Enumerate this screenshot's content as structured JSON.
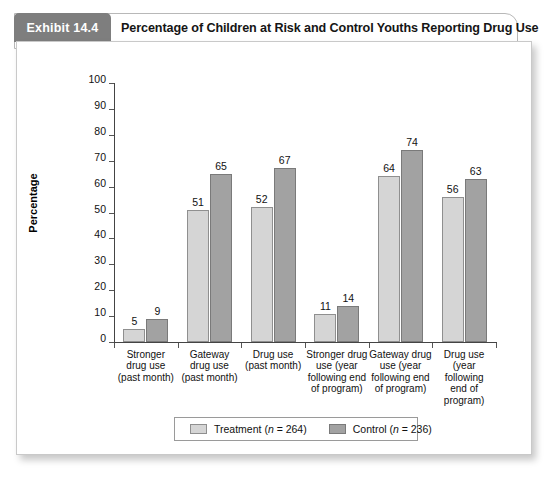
{
  "exhibit": {
    "tab_label": "Exhibit 14.4",
    "title": "Percentage of Children at Risk and Control Youths Reporting Drug Use"
  },
  "chart_data": {
    "type": "bar",
    "title": "Percentage of Children at Risk and Control Youths Reporting Drug Use",
    "xlabel": "",
    "ylabel": "Percentage",
    "ylim": [
      0,
      100
    ],
    "ytick_step": 10,
    "yticks": [
      0,
      10,
      20,
      30,
      40,
      50,
      60,
      70,
      80,
      90,
      100
    ],
    "grid": false,
    "legend_position": "bottom",
    "categories": [
      "Stronger drug use (past month)",
      "Gateway drug use (past month)",
      "Drug use (past month)",
      "Stronger drug use (year following end of program)",
      "Gateway drug use (year following end of program)",
      "Drug use (year following end of program)"
    ],
    "category_lines": [
      [
        "Stronger",
        "drug use",
        "(past month)"
      ],
      [
        "Gateway",
        "drug use",
        "(past month)"
      ],
      [
        "Drug use",
        "(past month)"
      ],
      [
        "Stronger drug",
        "use (year",
        "following end",
        "of program)"
      ],
      [
        "Gateway drug",
        "use (year",
        "following end",
        "of program)"
      ],
      [
        "Drug use",
        "(year following",
        "end of",
        "program)"
      ]
    ],
    "series": [
      {
        "name": "Treatment (n = 264)",
        "legend_label_text": "Treatment (",
        "legend_label_italic": "n",
        "legend_label_tail": " = 264)",
        "color": "#d5d5d5",
        "values": [
          5,
          51,
          52,
          11,
          64,
          56
        ]
      },
      {
        "name": "Control (n = 236)",
        "legend_label_text": "Control (",
        "legend_label_italic": "n",
        "legend_label_tail": " = 236)",
        "color": "#a2a2a2",
        "values": [
          9,
          65,
          67,
          14,
          74,
          63
        ]
      }
    ]
  }
}
